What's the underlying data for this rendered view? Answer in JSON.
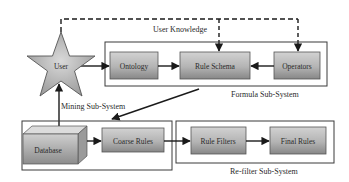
{
  "diagram": {
    "type": "system-architecture",
    "actor": {
      "id": "user",
      "label": "User",
      "shape": "star-icon"
    },
    "dashed_link_label": "User Knowledge",
    "subsystems": [
      {
        "id": "formula",
        "label": "Formula Sub-System",
        "nodes": [
          "ontology",
          "rule_schema",
          "operators"
        ]
      },
      {
        "id": "mining",
        "label": "Mining Sub-System",
        "nodes": [
          "database",
          "coarse_rules"
        ]
      },
      {
        "id": "refilter",
        "label": "Re-filter Sub-System",
        "nodes": [
          "rule_filters",
          "final_rules"
        ]
      }
    ],
    "nodes": {
      "ontology": "Ontology",
      "rule_schema": "Rule Schema",
      "operators": "Operators",
      "database": "Database",
      "coarse_rules": "Coarse Rules",
      "rule_filters": "Rule Filters",
      "final_rules": "Final Rules"
    },
    "edges": [
      {
        "from": "user",
        "to": "ontology",
        "style": "solid"
      },
      {
        "from": "ontology",
        "to": "rule_schema",
        "style": "solid"
      },
      {
        "from": "operators",
        "to": "rule_schema",
        "style": "solid"
      },
      {
        "from": "user",
        "to": "rule_schema",
        "style": "dashed",
        "label": "User Knowledge"
      },
      {
        "from": "user",
        "to": "operators",
        "style": "dashed"
      },
      {
        "from": "database",
        "to": "user",
        "style": "solid"
      },
      {
        "from": "formula",
        "to": "mining",
        "style": "solid"
      },
      {
        "from": "database",
        "to": "coarse_rules",
        "style": "solid"
      },
      {
        "from": "coarse_rules",
        "to": "rule_filters",
        "style": "solid"
      },
      {
        "from": "rule_filters",
        "to": "final_rules",
        "style": "solid"
      }
    ],
    "colors": {
      "box_top": "#c9c9c9",
      "box_bottom": "#8a8a8a",
      "line": "#1a1a1a",
      "frame": "#3a3a3a"
    }
  }
}
